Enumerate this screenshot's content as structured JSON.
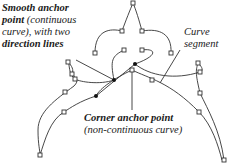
{
  "labels": {
    "smooth": {
      "bold1": "Smooth anchor",
      "bold2": "point",
      "normal2": " (continuous",
      "normal3": "curve), with two",
      "bold4": "direction lines"
    },
    "curve": {
      "line1": "Curve",
      "line2": "segment"
    },
    "corner": {
      "line1": "Corner anchor point",
      "line2": "(non-continuous curve)"
    }
  },
  "colors": {
    "stroke": "#333333",
    "text": "#1a1a1a",
    "background": "#ffffff"
  }
}
